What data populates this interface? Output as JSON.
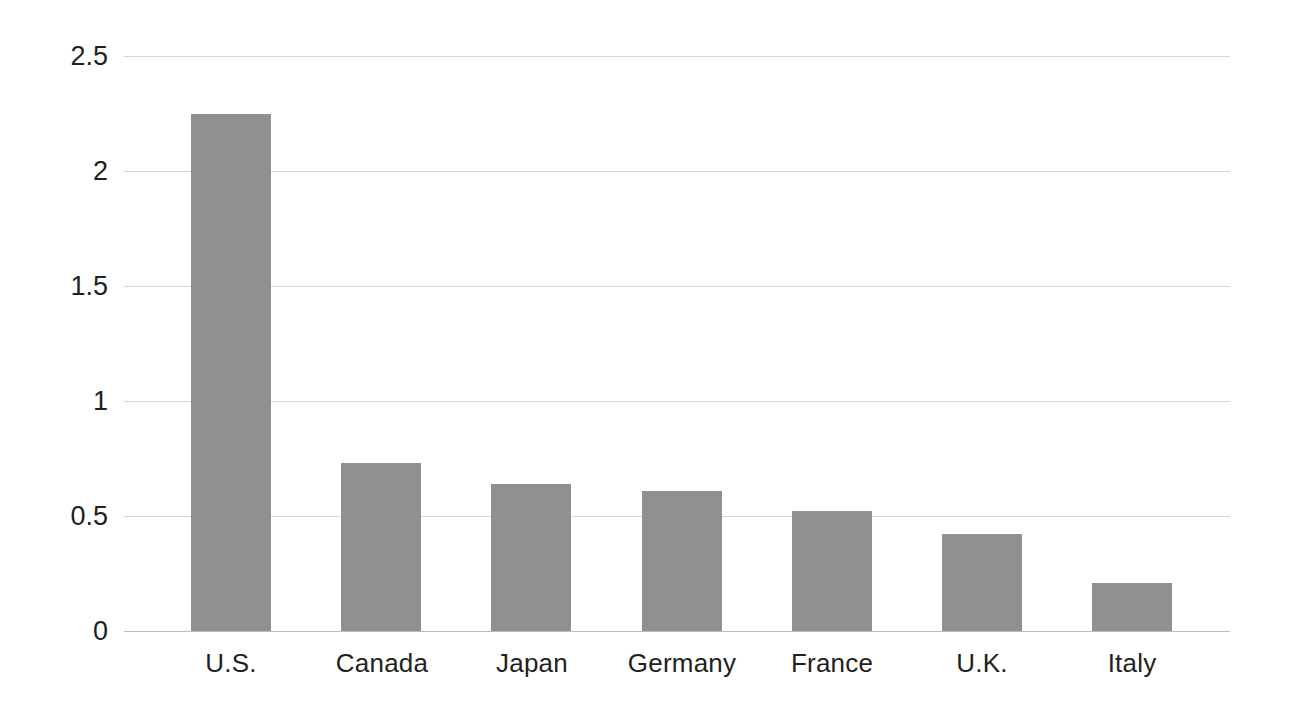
{
  "chart_data": {
    "type": "bar",
    "title": "",
    "subtitle": "",
    "xlabel": "",
    "ylabel": "",
    "categories": [
      "U.S.",
      "Canada",
      "Japan",
      "Germany",
      "France",
      "U.K.",
      "Italy"
    ],
    "values": [
      2.25,
      0.73,
      0.64,
      0.61,
      0.52,
      0.42,
      0.21
    ],
    "ylim": [
      0,
      2.5
    ],
    "ytick_labels": [
      "0",
      "0.5",
      "1",
      "1.5",
      "2",
      "2.5"
    ],
    "ytick_values": [
      0,
      0.5,
      1,
      1.5,
      2,
      2.5
    ],
    "grid": "horizontal",
    "legend": "none",
    "annotations": [],
    "series": [
      {
        "name": "Value",
        "values": [
          2.25,
          0.73,
          0.64,
          0.61,
          0.52,
          0.42,
          0.21
        ]
      }
    ]
  },
  "style": {
    "background": "#ffffff",
    "bar_color": "#909090",
    "gridline_color": "#d6d6d6",
    "baseline_color": "#bdbdbd",
    "text_color": "#231f20"
  }
}
